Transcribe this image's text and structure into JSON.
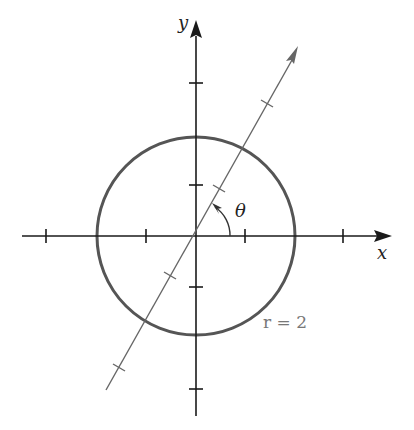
{
  "diagram": {
    "axes": {
      "x_label": "x",
      "y_label": "y"
    },
    "angle_label": "θ",
    "circle_label": "r = 2",
    "colors": {
      "axis": "#1a1a1a",
      "circle": "#555555",
      "ray": "#666666"
    }
  }
}
